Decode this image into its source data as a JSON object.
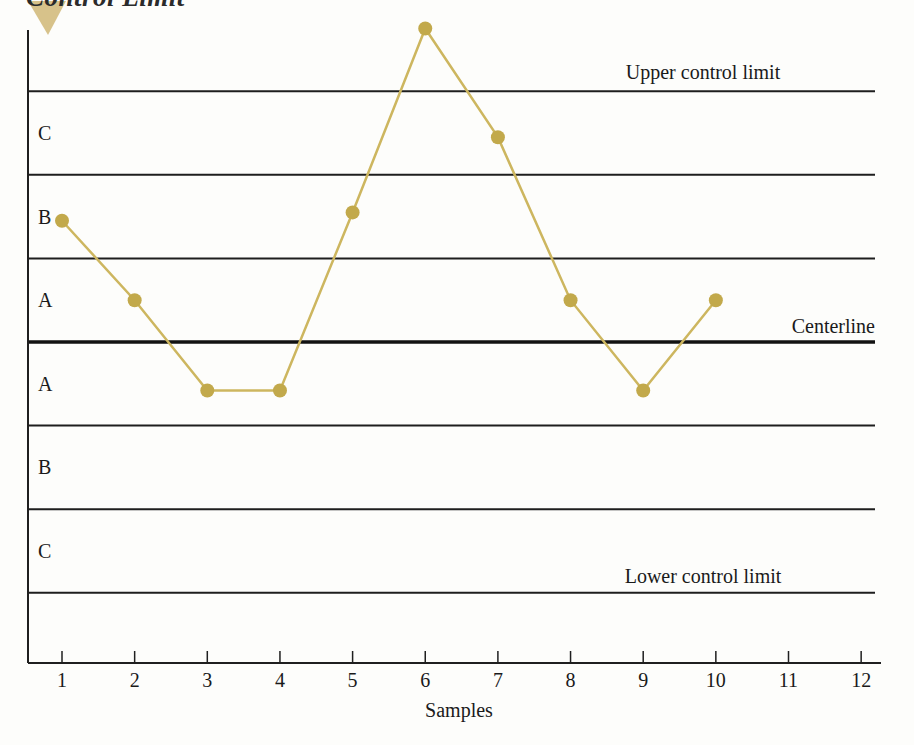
{
  "heading": {
    "text": "Control Limit"
  },
  "chart_data": {
    "type": "line",
    "xlabel": "Samples",
    "ylabel": "",
    "x_ticks": [
      1,
      2,
      3,
      4,
      5,
      6,
      7,
      8,
      9,
      10,
      11,
      12
    ],
    "x": [
      1,
      2,
      3,
      4,
      5,
      6,
      7,
      8,
      9,
      10
    ],
    "values": [
      1.45,
      0.5,
      -0.58,
      -0.58,
      1.55,
      3.75,
      2.45,
      0.5,
      -0.58,
      0.5
    ],
    "value_units": "sigma zones from centerline",
    "sigma_gridlines": [
      3,
      2,
      1,
      0,
      -1,
      -2,
      -3
    ],
    "zone_labels": [
      "C",
      "B",
      "A",
      "A",
      "B",
      "C"
    ],
    "annotations": {
      "upper": "Upper control limit",
      "center": "Centerline",
      "lower": "Lower control limit"
    },
    "legend": "none",
    "grid": "horizontal zone lines only",
    "ylim": [
      -3.9,
      3.9
    ]
  },
  "colors": {
    "series_line": "#cdb65f",
    "marker": "#c2a94b",
    "axis": "#1f1f1f",
    "zone_line": "#1e1e1e",
    "centerline": "#121212",
    "triangle": "#d7c28a",
    "text": "#1a1a1a",
    "background": "#fdfdfb"
  }
}
